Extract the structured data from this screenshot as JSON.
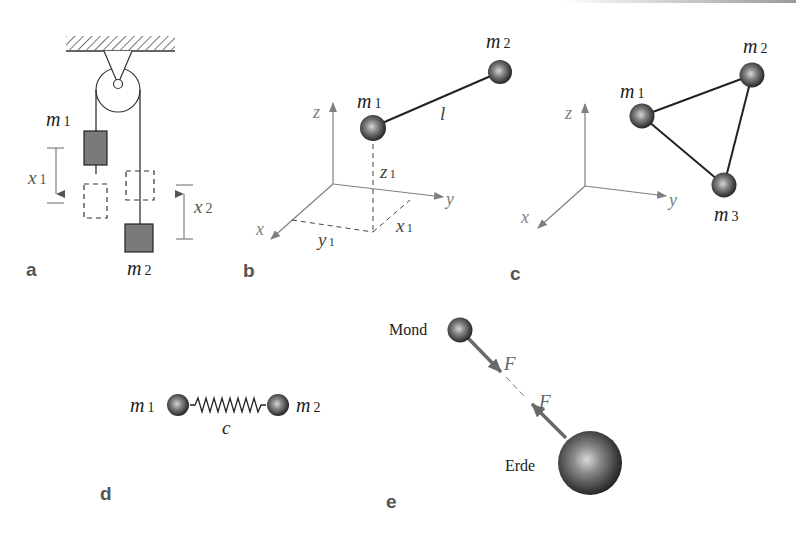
{
  "figure": {
    "panels": {
      "a": {
        "label": "a",
        "description": "Atwood machine: two masses on a pulley",
        "mass1": {
          "symbol": "m",
          "sub": "1"
        },
        "mass2": {
          "symbol": "m",
          "sub": "2"
        },
        "disp1": {
          "symbol": "x",
          "sub": "1"
        },
        "disp2": {
          "symbol": "x",
          "sub": "2"
        }
      },
      "b": {
        "label": "b",
        "description": "Two masses connected by rigid rod of length l in 3D coordinates",
        "axis_x": "x",
        "axis_y": "y",
        "axis_z": "z",
        "mass1": {
          "symbol": "m",
          "sub": "1"
        },
        "mass2": {
          "symbol": "m",
          "sub": "2"
        },
        "rod": "l",
        "coord_x1": {
          "symbol": "x",
          "sub": "1"
        },
        "coord_y1": {
          "symbol": "y",
          "sub": "1"
        },
        "coord_z1": {
          "symbol": "z",
          "sub": "1"
        }
      },
      "c": {
        "label": "c",
        "description": "Three masses forming a rigid triangle",
        "axis_x": "x",
        "axis_y": "y",
        "axis_z": "z",
        "mass1": {
          "symbol": "m",
          "sub": "1"
        },
        "mass2": {
          "symbol": "m",
          "sub": "2"
        },
        "mass3": {
          "symbol": "m",
          "sub": "3"
        }
      },
      "d": {
        "label": "d",
        "description": "Two masses coupled by spring with stiffness c",
        "mass1": {
          "symbol": "m",
          "sub": "1"
        },
        "mass2": {
          "symbol": "m",
          "sub": "2"
        },
        "spring": "c"
      },
      "e": {
        "label": "e",
        "description": "Moon and Earth attracting each other with force F",
        "moon": "Mond",
        "earth": "Erde",
        "force1": "F",
        "force2": "F"
      }
    },
    "colors": {
      "ink": "#222222",
      "axis": "#808080",
      "mass_fill": "#777777",
      "label_gray": "#555555"
    }
  }
}
